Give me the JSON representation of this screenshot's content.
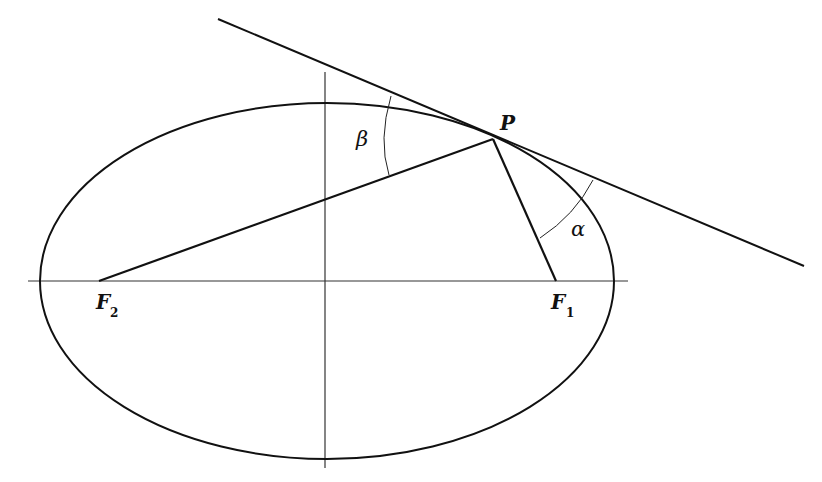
{
  "diagram": {
    "labels": {
      "point": "P",
      "focus1": "F",
      "focus1_sub": "1",
      "focus2": "F",
      "focus2_sub": "2",
      "angle_alpha": "α",
      "angle_beta": "β"
    },
    "ellipse": {
      "cx": 327,
      "cy": 281,
      "rx": 287,
      "ry": 178
    },
    "points": {
      "P": [
        493,
        139
      ],
      "F1": [
        556,
        281
      ],
      "F2": [
        99,
        281
      ]
    },
    "tangent_line": {
      "from": [
        218,
        19
      ],
      "to": [
        804,
        266
      ]
    },
    "axes": {
      "horizontal": {
        "from": [
          28,
          281
        ],
        "to": [
          628,
          281
        ]
      },
      "vertical": {
        "from": [
          325,
          72
        ],
        "to": [
          325,
          468
        ]
      }
    },
    "colors": {
      "stroke": "#111111",
      "background": "#ffffff"
    }
  }
}
